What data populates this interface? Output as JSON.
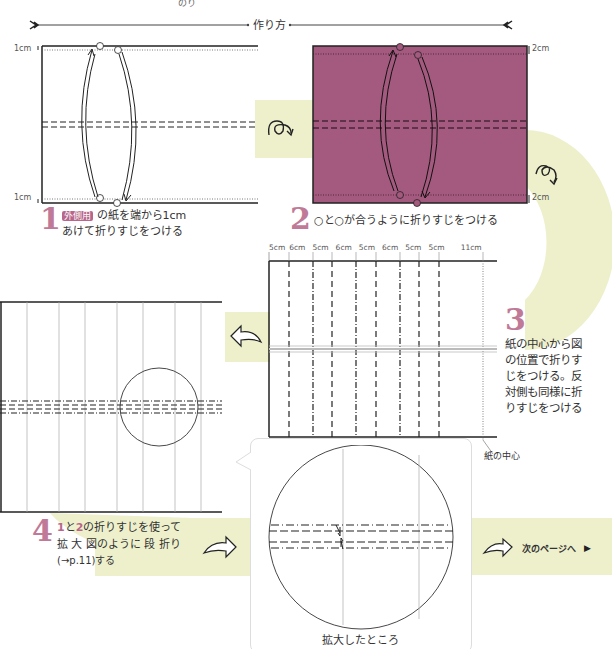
{
  "header": {
    "top_fragment": "のり",
    "section_title": "作り方"
  },
  "colors": {
    "accent_pink": "#b8668a",
    "paper_pink": "#a35a7e",
    "band_yellow": "#eef0cc"
  },
  "step1": {
    "number": "1",
    "tag": "外側用",
    "line1": "の紙を端から1cm",
    "line2": "あけて折りすじをつける",
    "label_top": "1cm",
    "label_bottom": "1cm"
  },
  "step2": {
    "number": "2",
    "text": "○と○が合うように折りすじをつける",
    "label_top": "2cm",
    "label_bottom": "2cm"
  },
  "step3": {
    "number": "3",
    "lines": [
      "紙の中心から図",
      "の位置で折りす",
      "じをつける。反",
      "対側も同様に折",
      "りすじをつける"
    ],
    "measurements": [
      "5cm",
      "6cm",
      "5cm",
      "6cm",
      "5cm",
      "6cm",
      "5cm",
      "5cm",
      "11cm"
    ],
    "center_label": "紙の中心"
  },
  "step4": {
    "number": "4",
    "ref1": "1",
    "mid1": "と",
    "ref2": "2",
    "line1_rest": "の折りすじを使って",
    "line2": "拡 大 図のように 段 折り",
    "line3": "(→p.11)する"
  },
  "zoom_callout": {
    "caption": "拡大したところ"
  },
  "next_page": {
    "label": "次のページへ",
    "arrow": "▶"
  },
  "icons": {
    "flip_over": "flip-over-icon",
    "rotate": "rotate-icon",
    "arrow_left": "arrow-left-icon",
    "arrow_right": "arrow-right-icon"
  }
}
